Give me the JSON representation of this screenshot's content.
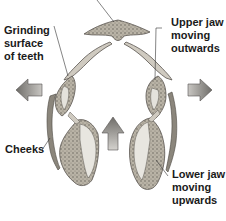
{
  "diagram": {
    "labels": {
      "grinding": "Grinding\nsurface\nof teeth",
      "upper_jaw": "Upper jaw\nmoving\noutwards",
      "cheeks": "Cheeks",
      "lower_jaw": "Lower jaw\nmoving\nupwards"
    },
    "arrows": [
      {
        "name": "left-arrow",
        "direction": "left"
      },
      {
        "name": "right-arrow",
        "direction": "right"
      },
      {
        "name": "up-arrow",
        "direction": "up"
      }
    ],
    "colors": {
      "tissue_fill": "#c9c4b8",
      "tissue_dark": "#6e6a62",
      "tooth_fill": "#e4e2dc",
      "outline": "#5a5650",
      "arrow_fill": "#8e8c88",
      "arrow_edge": "#555350",
      "text": "#1a1a1a"
    }
  }
}
